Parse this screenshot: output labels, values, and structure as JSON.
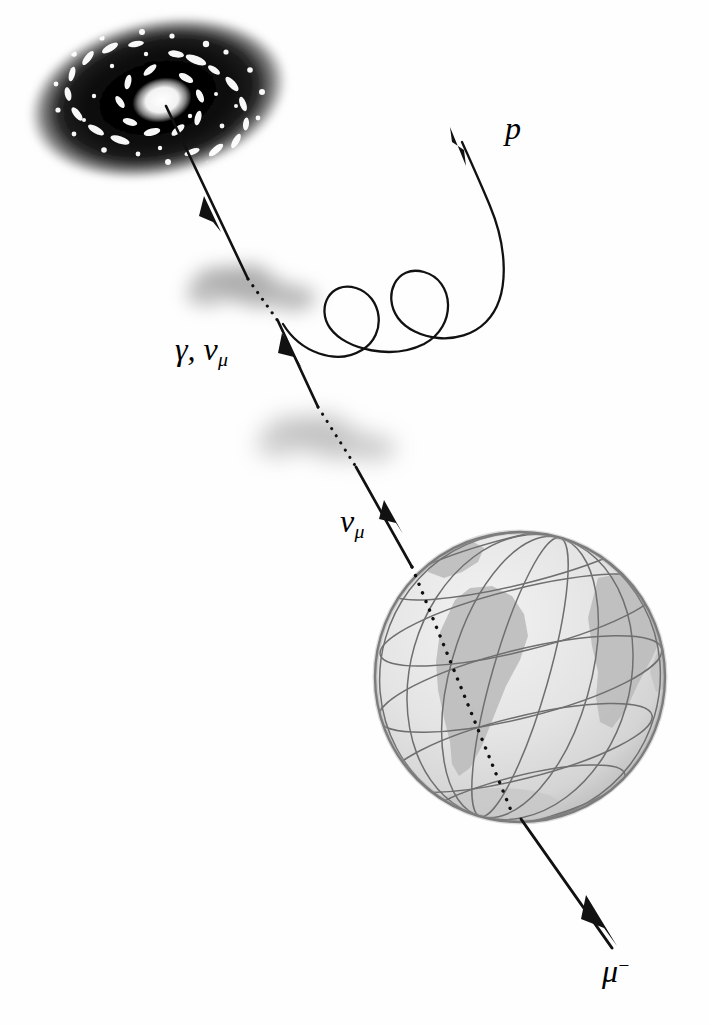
{
  "figure": {
    "background_color": "#fefefe",
    "width": 710,
    "height": 1026
  },
  "labels": {
    "gamma_numu": {
      "symbol": "γ, ν",
      "subscript": "μ",
      "name": "gamma and muon neutrino"
    },
    "numu": {
      "symbol": "ν",
      "subscript": "μ",
      "name": "muon neutrino"
    },
    "proton": {
      "symbol": "p",
      "name": "proton"
    },
    "muon": {
      "symbol": "μ",
      "superscript": "−",
      "name": "negative muon"
    }
  },
  "objects": {
    "galaxy": {
      "name": "spiral-galaxy",
      "center_x": 158,
      "center_y": 98,
      "radius_x": 132,
      "radius_y": 80,
      "rotation_deg": -12,
      "core_color": "#ffffff",
      "disk_color": "#0b0b0b",
      "halo_color": "#3a3a3a"
    },
    "earth": {
      "name": "earth-globe",
      "center_x": 520,
      "center_y": 677,
      "radius": 146,
      "ocean_color": "#e3e3e3",
      "land_color": "#bdbdbd",
      "graticule_color": "#6f6f6f",
      "outline_color": "#6a6a6a"
    },
    "gas_cloud_1": {
      "name": "interaction-cloud-upper",
      "center_x": 253,
      "center_y": 288,
      "radius_x": 64,
      "radius_y": 26,
      "color": "#9a9a9a"
    },
    "gas_cloud_2": {
      "name": "interaction-cloud-lower",
      "center_x": 325,
      "center_y": 437,
      "radius_x": 72,
      "radius_y": 25,
      "color": "#a8a8a8"
    }
  },
  "tracks": {
    "primary": {
      "name": "neutrino-photon-track",
      "stroke_color": "#111111",
      "description": "Line from galaxy core through two gas clouds into the Earth"
    },
    "proton": {
      "name": "proton-helix-track",
      "stroke_color": "#111111",
      "description": "Helical proton trajectory curving up and to the right"
    },
    "muon": {
      "name": "muon-track",
      "stroke_color": "#111111",
      "description": "Solid muon track exiting the bottom of the Earth"
    }
  }
}
